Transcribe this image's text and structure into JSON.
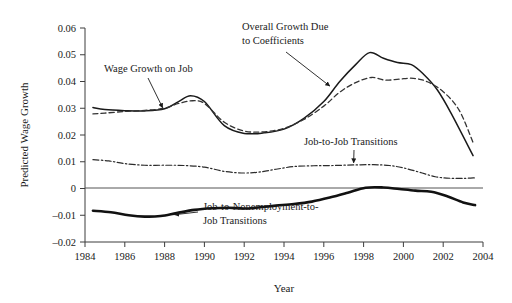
{
  "chart_data": {
    "type": "line",
    "title": "",
    "xlabel": "Year",
    "ylabel": "Predicted Wage Growth",
    "xlim": [
      1984,
      2004
    ],
    "ylim": [
      -0.02,
      0.06
    ],
    "grid": false,
    "legend_position": "none (inline annotations)",
    "xticks": [
      "1984",
      "1986",
      "1988",
      "1990",
      "1992",
      "1994",
      "1996",
      "1998",
      "2000",
      "2002",
      "2004"
    ],
    "yticks": [
      "0.06",
      "0.05",
      "0.04",
      "0.03",
      "0.02",
      "0.01",
      "0",
      "-0.01",
      "-0.02"
    ],
    "zero_reference_line": 0,
    "series": [
      {
        "name": "Overall Growth Due to Coefficients",
        "style": "solid-thin",
        "color": "#1a1a1a",
        "x": [
          1984.4,
          1985,
          1986,
          1987,
          1988,
          1988.7,
          1989.3,
          1990,
          1991,
          1992,
          1993,
          1994,
          1995,
          1996,
          1996.8,
          1997.6,
          1998.3,
          1999,
          1999.7,
          2000.4,
          2001,
          2001.7,
          2002.4,
          2003.5
        ],
        "y": [
          0.0303,
          0.0295,
          0.0291,
          0.029,
          0.0298,
          0.0325,
          0.0347,
          0.0325,
          0.0235,
          0.0206,
          0.0208,
          0.0222,
          0.0262,
          0.0325,
          0.04,
          0.0463,
          0.0508,
          0.0487,
          0.0471,
          0.0463,
          0.0428,
          0.0369,
          0.0281,
          0.0123
        ]
      },
      {
        "name": "Wage Growth on Job",
        "style": "dashed",
        "color": "#333333",
        "x": [
          1984.4,
          1985,
          1986,
          1987,
          1988,
          1988.7,
          1989.4,
          1990,
          1991,
          1992,
          1993,
          1994,
          1995,
          1996,
          1996.8,
          1997.6,
          1998.4,
          1999.1,
          1999.8,
          2000.5,
          2001.2,
          2002,
          2002.8,
          2003.5
        ],
        "y": [
          0.0279,
          0.0282,
          0.0288,
          0.0292,
          0.03,
          0.0318,
          0.0328,
          0.0318,
          0.0248,
          0.0215,
          0.0212,
          0.0225,
          0.0258,
          0.0308,
          0.036,
          0.0396,
          0.0415,
          0.0405,
          0.0409,
          0.0412,
          0.0399,
          0.0362,
          0.0293,
          0.0172
        ]
      },
      {
        "name": "Job-to-Job Transitions",
        "style": "dash-dot",
        "color": "#2b2b2b",
        "x": [
          1984.4,
          1985.2,
          1986,
          1987,
          1988,
          1989,
          1990,
          1991,
          1992,
          1992.8,
          1993.6,
          1994.5,
          1995.5,
          1996.5,
          1997.5,
          1998.5,
          1999.3,
          2000,
          2000.8,
          2001.6,
          2002.4,
          2003.1,
          2003.6
        ],
        "y": [
          0.0108,
          0.0103,
          0.0093,
          0.0087,
          0.0087,
          0.0086,
          0.008,
          0.0064,
          0.0058,
          0.0062,
          0.0072,
          0.0082,
          0.0085,
          0.0086,
          0.0088,
          0.0089,
          0.0086,
          0.0077,
          0.0061,
          0.0044,
          0.0038,
          0.0038,
          0.004
        ]
      },
      {
        "name": "Job-to-Nonemployment-to-Job Transitions",
        "style": "solid-thick",
        "color": "#111111",
        "x": [
          1984.4,
          1985.3,
          1986.2,
          1987,
          1987.8,
          1988.6,
          1989.5,
          1990.4,
          1991.2,
          1992,
          1992.8,
          1993.6,
          1994.5,
          1995.4,
          1996.3,
          1997.2,
          1998.1,
          1999,
          1999.8,
          2000.6,
          2001.4,
          2002.2,
          2003,
          2003.6
        ],
        "y": [
          -0.0083,
          -0.0089,
          -0.01,
          -0.0105,
          -0.0103,
          -0.0092,
          -0.008,
          -0.0074,
          -0.0072,
          -0.0075,
          -0.007,
          -0.0064,
          -0.0058,
          -0.0049,
          -0.0034,
          -0.0016,
          0.0003,
          0.0004,
          -0.0002,
          -0.0008,
          -0.0012,
          -0.0029,
          -0.0052,
          -0.0062
        ]
      }
    ],
    "annotations": [
      {
        "id": "wage-growth-on-job",
        "text": "Wage Growth on Job",
        "text_lines": [
          "Wage Growth on Job"
        ],
        "target_x": 1987.9,
        "target_y": 0.0302
      },
      {
        "id": "overall-growth-due-to-coefficients",
        "text": "Overall Growth Due to Coefficients",
        "text_lines": [
          "Overall Growth Due",
          "to Coefficients"
        ],
        "target_x": 1996.3,
        "target_y": 0.0383
      },
      {
        "id": "job-to-job-transitions",
        "text": "Job-to-Job Transitions",
        "text_lines": [
          "Job-to-Job Transitions"
        ],
        "target_x": 1997.5,
        "target_y": 0.0096
      },
      {
        "id": "job-to-nonemployment-to-job-transitions",
        "text": "Job-to-Nonemployment-to-Job Transitions",
        "text_lines": [
          "Job-to-Nonemployment-to-",
          "Job Transitions"
        ],
        "target_x": 1988.5,
        "target_y": -0.0098
      }
    ]
  },
  "colors": {
    "background": "#ffffff",
    "axis": "#3d3d3d",
    "text": "#1a1a1a",
    "zero_line": "#555555"
  }
}
